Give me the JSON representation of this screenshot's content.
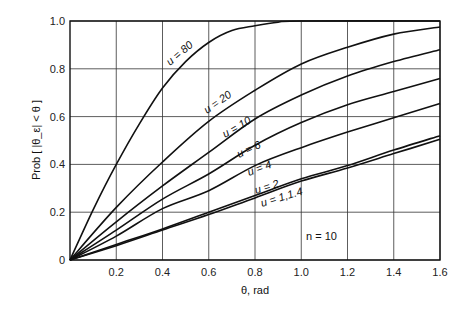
{
  "chart_data": {
    "type": "line",
    "title": "",
    "xlabel": "θ, rad",
    "ylabel": "Prob [ |θ_ε| < θ ]",
    "xlim": [
      0,
      1.6
    ],
    "ylim": [
      0,
      1.0
    ],
    "grid": true,
    "x_ticks": [
      "0.2",
      "0.4",
      "0.6",
      "0.8",
      "1.0",
      "1.2",
      "1.4",
      "1.6"
    ],
    "y_ticks": [
      "0",
      "0.2",
      "0.4",
      "0.6",
      "0.8",
      "1.0"
    ],
    "annotation": "n = 10",
    "series": [
      {
        "name": "u = 80",
        "x": [
          0,
          0.1,
          0.2,
          0.3,
          0.4,
          0.5,
          0.6,
          0.7,
          0.8,
          0.9,
          1.0,
          1.6
        ],
        "values": [
          0,
          0.21,
          0.4,
          0.57,
          0.72,
          0.83,
          0.91,
          0.96,
          0.98,
          0.995,
          1.0,
          1.0
        ]
      },
      {
        "name": "u = 20",
        "x": [
          0,
          0.2,
          0.4,
          0.6,
          0.8,
          1.0,
          1.2,
          1.4,
          1.6
        ],
        "values": [
          0,
          0.22,
          0.41,
          0.58,
          0.71,
          0.82,
          0.89,
          0.945,
          0.975
        ]
      },
      {
        "name": "u = 10",
        "x": [
          0,
          0.2,
          0.4,
          0.6,
          0.8,
          1.0,
          1.2,
          1.4,
          1.6
        ],
        "values": [
          0,
          0.16,
          0.31,
          0.45,
          0.59,
          0.69,
          0.77,
          0.83,
          0.88
        ]
      },
      {
        "name": "u = 6",
        "x": [
          0,
          0.2,
          0.4,
          0.6,
          0.8,
          1.0,
          1.2,
          1.4,
          1.6
        ],
        "values": [
          0,
          0.125,
          0.255,
          0.36,
          0.48,
          0.575,
          0.65,
          0.705,
          0.76
        ]
      },
      {
        "name": "u = 4",
        "x": [
          0,
          0.2,
          0.4,
          0.6,
          0.8,
          1.0,
          1.2,
          1.4,
          1.6
        ],
        "values": [
          0,
          0.1,
          0.215,
          0.29,
          0.395,
          0.47,
          0.535,
          0.595,
          0.655
        ]
      },
      {
        "name": "u = 2",
        "x": [
          0,
          0.2,
          0.4,
          0.6,
          0.8,
          1.0,
          1.2,
          1.4,
          1.6
        ],
        "values": [
          0,
          0.065,
          0.13,
          0.2,
          0.27,
          0.34,
          0.395,
          0.46,
          0.52
        ]
      },
      {
        "name": "u = 1,1.4",
        "x": [
          0,
          0.2,
          0.4,
          0.6,
          0.8,
          1.0,
          1.2,
          1.4,
          1.6
        ],
        "values": [
          0,
          0.06,
          0.125,
          0.19,
          0.26,
          0.33,
          0.385,
          0.445,
          0.505
        ]
      }
    ],
    "curve_labels": [
      {
        "text": "u = 80",
        "x": 170,
        "y": 66,
        "rot": -40
      },
      {
        "text": "u = 20",
        "x": 207,
        "y": 114,
        "rot": -35
      },
      {
        "text": "u = 10",
        "x": 225,
        "y": 138,
        "rot": -30
      },
      {
        "text": "u = 6",
        "x": 239,
        "y": 158,
        "rot": -25
      },
      {
        "text": "u = 4",
        "x": 249,
        "y": 176,
        "rot": -20
      },
      {
        "text": "u = 2",
        "x": 256,
        "y": 194,
        "rot": -17
      },
      {
        "text": "u = 1,1.4",
        "x": 262,
        "y": 207,
        "rot": -17
      }
    ]
  },
  "colors": {
    "line": "#111111",
    "grid": "#333333",
    "background": "#ffffff"
  }
}
